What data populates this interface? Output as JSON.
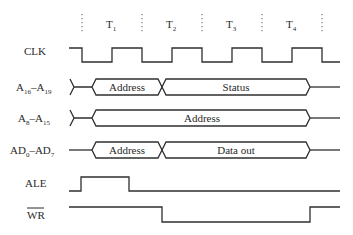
{
  "diagram": {
    "type": "timing-diagram",
    "clock_states": [
      {
        "label": "T",
        "sub": "1"
      },
      {
        "label": "T",
        "sub": "2"
      },
      {
        "label": "T",
        "sub": "3"
      },
      {
        "label": "T",
        "sub": "4"
      }
    ],
    "signals": [
      {
        "id": "clk",
        "label": "CLK",
        "label_html": "CLK"
      },
      {
        "id": "a16_a19",
        "label": "A16 – A19",
        "main": "A",
        "sub1": "16",
        "dash": "–",
        "main2": "A",
        "sub2": "19",
        "segments": [
          {
            "text": "Address"
          },
          {
            "text": "Status"
          }
        ]
      },
      {
        "id": "a8_a15",
        "label": "A8 – A15",
        "main": "A",
        "sub1": "8",
        "dash": "–",
        "main2": "A",
        "sub2": "15",
        "segments": [
          {
            "text": "Address"
          }
        ]
      },
      {
        "id": "ad0_ad7",
        "label": "AD0 – AD7",
        "main": "AD",
        "sub1": "0",
        "dash": "–",
        "main2": "AD",
        "sub2": "7",
        "segments": [
          {
            "text": "Address"
          },
          {
            "text": "Data out"
          }
        ]
      },
      {
        "id": "ale",
        "label": "ALE"
      },
      {
        "id": "wr",
        "label": "WR",
        "overbar": true
      }
    ]
  }
}
